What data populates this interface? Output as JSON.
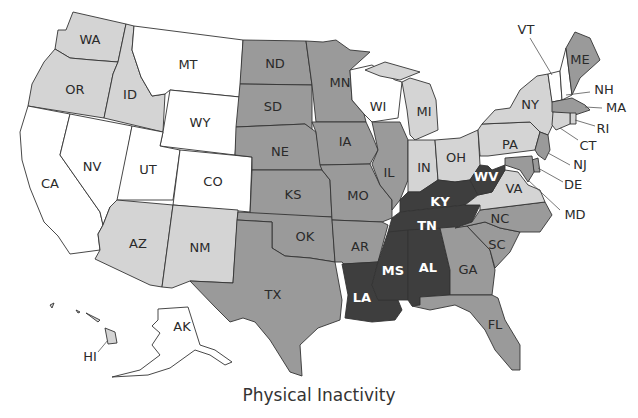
{
  "title": "Physical Inactivity",
  "legend_levels": {
    "1": {
      "name": "lowest",
      "color": "#ffffff"
    },
    "2": {
      "name": "low",
      "color": "#d4d4d4"
    },
    "3": {
      "name": "high",
      "color": "#9a9a9a"
    },
    "4": {
      "name": "highest",
      "color": "#3e3e3e"
    }
  },
  "chart_data": {
    "type": "choropleth",
    "title": "Physical Inactivity",
    "scale": "ordinal grayscale, 4 levels (1 = lightest/lowest, 4 = darkest/highest)",
    "states": {
      "WA": 2,
      "OR": 2,
      "CA": 1,
      "NV": 1,
      "ID": 2,
      "MT": 1,
      "WY": 1,
      "UT": 1,
      "CO": 1,
      "AZ": 2,
      "NM": 2,
      "ND": 3,
      "SD": 3,
      "NE": 3,
      "KS": 3,
      "OK": 3,
      "TX": 3,
      "MN": 3,
      "IA": 3,
      "MO": 3,
      "AR": 3,
      "LA": 4,
      "WI": 1,
      "IL": 3,
      "MI": 2,
      "IN": 2,
      "OH": 2,
      "KY": 4,
      "TN": 4,
      "MS": 4,
      "AL": 4,
      "GA": 3,
      "FL": 3,
      "SC": 3,
      "NC": 3,
      "VA": 2,
      "WV": 4,
      "PA": 2,
      "NY": 2,
      "VT": 1,
      "NH": 1,
      "ME": 3,
      "MA": 3,
      "RI": 2,
      "CT": 2,
      "NJ": 3,
      "DE": 3,
      "MD": 3,
      "AK": 1,
      "HI": 2
    }
  },
  "labels": {
    "WA": "WA",
    "OR": "OR",
    "CA": "CA",
    "NV": "NV",
    "ID": "ID",
    "MT": "MT",
    "WY": "WY",
    "UT": "UT",
    "CO": "CO",
    "AZ": "AZ",
    "NM": "NM",
    "ND": "ND",
    "SD": "SD",
    "NE": "NE",
    "KS": "KS",
    "OK": "OK",
    "TX": "TX",
    "MN": "MN",
    "IA": "IA",
    "MO": "MO",
    "AR": "AR",
    "LA": "LA",
    "WI": "WI",
    "IL": "IL",
    "MI": "MI",
    "IN": "IN",
    "OH": "OH",
    "KY": "KY",
    "TN": "TN",
    "MS": "MS",
    "AL": "AL",
    "GA": "GA",
    "FL": "FL",
    "SC": "SC",
    "NC": "NC",
    "VA": "VA",
    "WV": "WV",
    "PA": "PA",
    "NY": "NY",
    "VT": "VT",
    "NH": "NH",
    "ME": "ME",
    "MA": "MA",
    "RI": "RI",
    "CT": "CT",
    "NJ": "NJ",
    "DE": "DE",
    "MD": "MD",
    "AK": "AK",
    "HI": "HI"
  }
}
